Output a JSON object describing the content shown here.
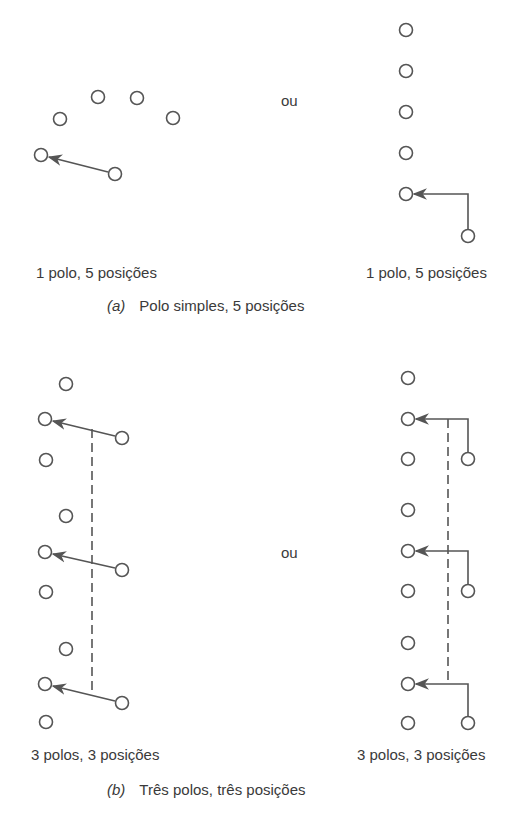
{
  "figure": {
    "part_a": {
      "left_label": "1 polo, 5 posições",
      "right_label": "1 polo, 5 posições",
      "separator": "ou",
      "caption_tag": "(a)",
      "caption_text": "Polo simples, 5 posições"
    },
    "part_b": {
      "left_label": "3 polos, 3 posições",
      "right_label": "3 polos, 3 posições",
      "separator": "ou",
      "caption_tag": "(b)",
      "caption_text": "Três polos, três posições"
    },
    "colors": {
      "stroke": "#555555",
      "text": "#3a3a3a",
      "background": "#ffffff"
    }
  }
}
